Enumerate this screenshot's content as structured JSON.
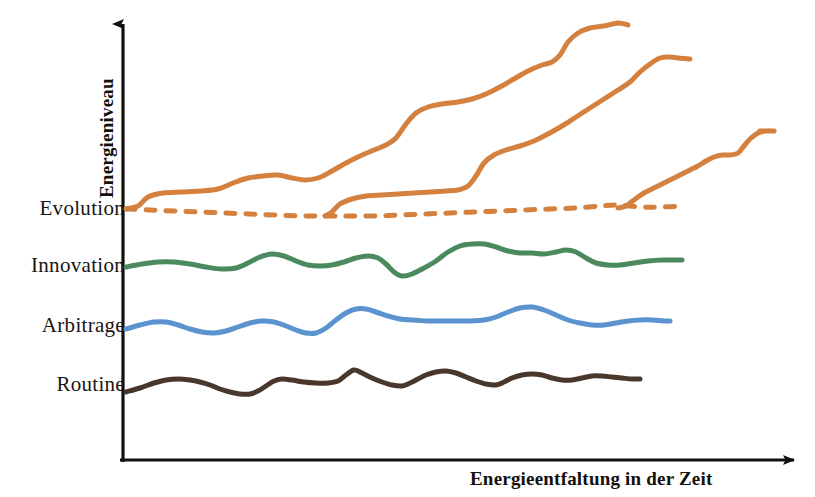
{
  "figure": {
    "title": "",
    "background": "#ffffff",
    "axis_color": "#14100d"
  },
  "axes": {
    "y_label": "Energieniveau",
    "x_label": "Energieentfaltung in der Zeit",
    "y_axis_x": 123,
    "x_axis_y": 460,
    "y_axis_top": 12,
    "x_axis_right": 806
  },
  "level_labels": [
    {
      "name": "evolution",
      "text": "Evolution",
      "y": 209,
      "color": "#1b1511"
    },
    {
      "name": "innovation",
      "text": "Innovation",
      "y": 266,
      "color": "#1b1511"
    },
    {
      "name": "arbitrage",
      "text": "Arbitrage",
      "y": 326,
      "color": "#1b1511"
    },
    {
      "name": "routine",
      "text": "Routine",
      "y": 385,
      "color": "#1b1511"
    }
  ],
  "colors": {
    "orange": "#d4813f",
    "green": "#4a8a5e",
    "blue": "#5b92d0",
    "brown": "#4a372c",
    "axis": "#14100d"
  },
  "chart_data": {
    "type": "line",
    "title": "",
    "xlabel": "Energieentfaltung in der Zeit",
    "ylabel": "Energieniveau",
    "grid": false,
    "legend": "inline-left-labels",
    "xlim": [
      123,
      806
    ],
    "ylim": [
      460,
      12
    ],
    "axis_style": "hand-drawn arrows, no tick marks, no numeric scale",
    "level_bands": {
      "Evolution": 209,
      "Innovation": 266,
      "Arbitrage": 326,
      "Routine": 385
    },
    "series": [
      {
        "name": "Evolution baseline",
        "level": "Evolution",
        "color": "#d4813f",
        "style": "dashed",
        "width": 5,
        "points": [
          [
            126,
            209
          ],
          [
            150,
            210
          ],
          [
            175,
            211
          ],
          [
            200,
            212
          ],
          [
            225,
            213
          ],
          [
            250,
            214
          ],
          [
            275,
            215
          ],
          [
            300,
            216
          ],
          [
            325,
            216
          ],
          [
            350,
            216
          ],
          [
            375,
            216
          ],
          [
            400,
            215
          ],
          [
            425,
            214
          ],
          [
            450,
            213
          ],
          [
            475,
            212
          ],
          [
            500,
            211
          ],
          [
            525,
            210
          ],
          [
            550,
            209
          ],
          [
            575,
            208
          ],
          [
            600,
            206
          ],
          [
            618,
            205
          ],
          [
            640,
            207
          ],
          [
            660,
            207
          ],
          [
            685,
            206
          ]
        ]
      },
      {
        "name": "Evolution wave 1",
        "level": "Evolution",
        "color": "#d4813f",
        "style": "solid",
        "width": 5,
        "branch_x": 128,
        "points": [
          [
            126,
            209
          ],
          [
            138,
            206
          ],
          [
            148,
            197
          ],
          [
            163,
            193
          ],
          [
            182,
            192
          ],
          [
            200,
            191
          ],
          [
            218,
            189
          ],
          [
            233,
            183
          ],
          [
            248,
            178
          ],
          [
            262,
            176
          ],
          [
            278,
            175
          ],
          [
            292,
            178
          ],
          [
            305,
            180
          ],
          [
            318,
            178
          ],
          [
            332,
            171
          ],
          [
            346,
            163
          ],
          [
            360,
            156
          ],
          [
            374,
            150
          ],
          [
            386,
            145
          ],
          [
            396,
            138
          ],
          [
            406,
            124
          ],
          [
            416,
            113
          ],
          [
            428,
            107
          ],
          [
            442,
            104
          ],
          [
            458,
            102
          ],
          [
            472,
            99
          ],
          [
            486,
            94
          ],
          [
            500,
            87
          ],
          [
            514,
            79
          ],
          [
            528,
            71
          ],
          [
            542,
            65
          ],
          [
            552,
            62
          ],
          [
            560,
            55
          ],
          [
            568,
            42
          ],
          [
            578,
            33
          ],
          [
            590,
            28
          ],
          [
            604,
            26
          ],
          [
            618,
            23
          ],
          [
            628,
            25
          ]
        ]
      },
      {
        "name": "Evolution wave 2",
        "level": "Evolution",
        "color": "#d4813f",
        "style": "solid",
        "width": 5,
        "branch_x": 325,
        "points": [
          [
            325,
            216
          ],
          [
            332,
            212
          ],
          [
            340,
            204
          ],
          [
            352,
            199
          ],
          [
            366,
            196
          ],
          [
            382,
            195
          ],
          [
            398,
            194
          ],
          [
            414,
            193
          ],
          [
            430,
            192
          ],
          [
            446,
            191
          ],
          [
            458,
            190
          ],
          [
            468,
            186
          ],
          [
            476,
            176
          ],
          [
            484,
            163
          ],
          [
            494,
            155
          ],
          [
            506,
            150
          ],
          [
            520,
            146
          ],
          [
            534,
            141
          ],
          [
            548,
            134
          ],
          [
            562,
            126
          ],
          [
            576,
            117
          ],
          [
            590,
            108
          ],
          [
            604,
            99
          ],
          [
            618,
            90
          ],
          [
            630,
            82
          ],
          [
            640,
            72
          ],
          [
            650,
            64
          ],
          [
            660,
            58
          ],
          [
            670,
            57
          ],
          [
            678,
            58
          ],
          [
            690,
            59
          ]
        ]
      },
      {
        "name": "Evolution wave 3",
        "level": "Evolution",
        "color": "#d4813f",
        "style": "solid",
        "width": 5,
        "branch_x": 618,
        "points": [
          [
            618,
            208
          ],
          [
            626,
            206
          ],
          [
            634,
            200
          ],
          [
            644,
            193
          ],
          [
            656,
            187
          ],
          [
            668,
            181
          ],
          [
            680,
            175
          ],
          [
            690,
            170
          ],
          [
            698,
            166
          ],
          [
            706,
            161
          ],
          [
            714,
            157
          ],
          [
            722,
            155
          ],
          [
            730,
            155
          ],
          [
            738,
            153
          ],
          [
            744,
            146
          ],
          [
            750,
            139
          ],
          [
            758,
            133
          ],
          [
            766,
            131
          ],
          [
            774,
            131
          ],
          [
            760,
            131
          ],
          [
            766,
            131
          ]
        ]
      },
      {
        "name": "Innovation",
        "level": "Innovation",
        "color": "#4a8a5e",
        "style": "solid",
        "width": 5,
        "points": [
          [
            126,
            267
          ],
          [
            142,
            264
          ],
          [
            158,
            262
          ],
          [
            174,
            262
          ],
          [
            190,
            264
          ],
          [
            206,
            267
          ],
          [
            222,
            269
          ],
          [
            236,
            268
          ],
          [
            248,
            263
          ],
          [
            260,
            257
          ],
          [
            272,
            254
          ],
          [
            284,
            256
          ],
          [
            296,
            261
          ],
          [
            308,
            265
          ],
          [
            320,
            266
          ],
          [
            332,
            265
          ],
          [
            344,
            262
          ],
          [
            356,
            258
          ],
          [
            368,
            256
          ],
          [
            378,
            258
          ],
          [
            386,
            264
          ],
          [
            394,
            272
          ],
          [
            402,
            276
          ],
          [
            412,
            274
          ],
          [
            424,
            268
          ],
          [
            436,
            261
          ],
          [
            448,
            252
          ],
          [
            460,
            246
          ],
          [
            472,
            244
          ],
          [
            484,
            244
          ],
          [
            496,
            247
          ],
          [
            508,
            251
          ],
          [
            520,
            253
          ],
          [
            532,
            253
          ],
          [
            544,
            254
          ],
          [
            556,
            252
          ],
          [
            566,
            250
          ],
          [
            576,
            252
          ],
          [
            586,
            258
          ],
          [
            596,
            263
          ],
          [
            608,
            265
          ],
          [
            620,
            265
          ],
          [
            634,
            263
          ],
          [
            648,
            261
          ],
          [
            662,
            260
          ],
          [
            676,
            260
          ],
          [
            682,
            260
          ]
        ]
      },
      {
        "name": "Arbitrage",
        "level": "Arbitrage",
        "color": "#5b92d0",
        "style": "solid",
        "width": 5,
        "points": [
          [
            126,
            329
          ],
          [
            140,
            325
          ],
          [
            154,
            322
          ],
          [
            166,
            322
          ],
          [
            178,
            325
          ],
          [
            190,
            329
          ],
          [
            202,
            332
          ],
          [
            214,
            333
          ],
          [
            226,
            331
          ],
          [
            238,
            327
          ],
          [
            250,
            323
          ],
          [
            262,
            321
          ],
          [
            274,
            322
          ],
          [
            286,
            326
          ],
          [
            296,
            330
          ],
          [
            306,
            333
          ],
          [
            316,
            333
          ],
          [
            326,
            328
          ],
          [
            336,
            320
          ],
          [
            346,
            313
          ],
          [
            356,
            309
          ],
          [
            366,
            309
          ],
          [
            376,
            312
          ],
          [
            388,
            316
          ],
          [
            400,
            319
          ],
          [
            414,
            320
          ],
          [
            428,
            321
          ],
          [
            442,
            321
          ],
          [
            456,
            321
          ],
          [
            470,
            321
          ],
          [
            484,
            320
          ],
          [
            496,
            317
          ],
          [
            508,
            312
          ],
          [
            520,
            308
          ],
          [
            532,
            307
          ],
          [
            544,
            310
          ],
          [
            556,
            315
          ],
          [
            568,
            320
          ],
          [
            580,
            323
          ],
          [
            592,
            325
          ],
          [
            604,
            325
          ],
          [
            616,
            323
          ],
          [
            628,
            321
          ],
          [
            640,
            320
          ],
          [
            652,
            320
          ],
          [
            664,
            321
          ],
          [
            670,
            321
          ]
        ]
      },
      {
        "name": "Routine",
        "level": "Routine",
        "color": "#4a372c",
        "style": "solid",
        "width": 5,
        "points": [
          [
            126,
            392
          ],
          [
            140,
            388
          ],
          [
            154,
            383
          ],
          [
            166,
            380
          ],
          [
            178,
            379
          ],
          [
            190,
            380
          ],
          [
            200,
            382
          ],
          [
            210,
            385
          ],
          [
            220,
            389
          ],
          [
            230,
            392
          ],
          [
            240,
            394
          ],
          [
            250,
            394
          ],
          [
            258,
            391
          ],
          [
            266,
            386
          ],
          [
            274,
            381
          ],
          [
            282,
            379
          ],
          [
            292,
            380
          ],
          [
            304,
            382
          ],
          [
            316,
            383
          ],
          [
            328,
            383
          ],
          [
            338,
            381
          ],
          [
            346,
            375
          ],
          [
            354,
            370
          ],
          [
            362,
            373
          ],
          [
            372,
            378
          ],
          [
            382,
            382
          ],
          [
            392,
            385
          ],
          [
            402,
            386
          ],
          [
            410,
            383
          ],
          [
            418,
            379
          ],
          [
            426,
            375
          ],
          [
            436,
            372
          ],
          [
            446,
            371
          ],
          [
            456,
            373
          ],
          [
            466,
            377
          ],
          [
            476,
            381
          ],
          [
            486,
            384
          ],
          [
            496,
            385
          ],
          [
            504,
            382
          ],
          [
            512,
            378
          ],
          [
            522,
            375
          ],
          [
            532,
            374
          ],
          [
            542,
            375
          ],
          [
            552,
            378
          ],
          [
            562,
            380
          ],
          [
            572,
            380
          ],
          [
            582,
            378
          ],
          [
            592,
            376
          ],
          [
            602,
            376
          ],
          [
            612,
            377
          ],
          [
            622,
            378
          ],
          [
            632,
            379
          ],
          [
            640,
            379
          ]
        ]
      }
    ]
  }
}
